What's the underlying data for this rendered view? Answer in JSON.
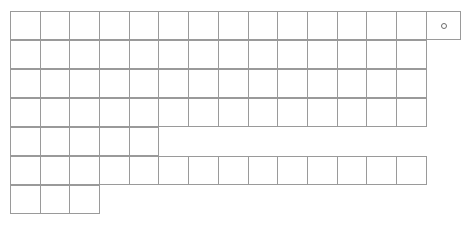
{
  "document": {
    "type": "blank-grid-worksheet",
    "background_color": "#ffffff",
    "line_color": "#9a9a9a",
    "mark_color": "#6d6d6d"
  },
  "grid": {
    "origin_x": 10,
    "origin_y": 11,
    "default_cell_width": 30.7,
    "default_cell_height": 29,
    "rows": [
      {
        "name": "row-1",
        "index": 1,
        "x": 10,
        "y": 11,
        "height": 29,
        "cells": [
          {
            "width": 30.7,
            "mark": ""
          },
          {
            "width": 30.7,
            "mark": ""
          },
          {
            "width": 30.7,
            "mark": ""
          },
          {
            "width": 30.7,
            "mark": ""
          },
          {
            "width": 30.7,
            "mark": ""
          },
          {
            "width": 30.7,
            "mark": ""
          },
          {
            "width": 30.7,
            "mark": ""
          },
          {
            "width": 30.7,
            "mark": ""
          },
          {
            "width": 30.7,
            "mark": ""
          },
          {
            "width": 30.7,
            "mark": ""
          },
          {
            "width": 30.7,
            "mark": ""
          },
          {
            "width": 30.7,
            "mark": ""
          },
          {
            "width": 30.7,
            "mark": ""
          },
          {
            "width": 30.7,
            "mark": ""
          },
          {
            "width": 35.8,
            "mark": "o"
          }
        ]
      },
      {
        "name": "row-2",
        "index": 2,
        "x": 10,
        "y": 40,
        "height": 29,
        "cells": [
          {
            "width": 30.7,
            "mark": ""
          },
          {
            "width": 30.7,
            "mark": ""
          },
          {
            "width": 30.7,
            "mark": ""
          },
          {
            "width": 30.7,
            "mark": ""
          },
          {
            "width": 30.7,
            "mark": ""
          },
          {
            "width": 30.7,
            "mark": ""
          },
          {
            "width": 30.7,
            "mark": ""
          },
          {
            "width": 30.7,
            "mark": ""
          },
          {
            "width": 30.7,
            "mark": ""
          },
          {
            "width": 30.7,
            "mark": ""
          },
          {
            "width": 30.7,
            "mark": ""
          },
          {
            "width": 30.7,
            "mark": ""
          },
          {
            "width": 30.7,
            "mark": ""
          },
          {
            "width": 30.7,
            "mark": ""
          }
        ]
      },
      {
        "name": "row-3",
        "index": 3,
        "x": 10,
        "y": 69,
        "height": 29,
        "cells": [
          {
            "width": 30.7,
            "mark": ""
          },
          {
            "width": 30.7,
            "mark": ""
          },
          {
            "width": 30.7,
            "mark": ""
          },
          {
            "width": 30.7,
            "mark": ""
          },
          {
            "width": 30.7,
            "mark": ""
          },
          {
            "width": 30.7,
            "mark": ""
          },
          {
            "width": 30.7,
            "mark": ""
          },
          {
            "width": 30.7,
            "mark": ""
          },
          {
            "width": 30.7,
            "mark": ""
          },
          {
            "width": 30.7,
            "mark": ""
          },
          {
            "width": 30.7,
            "mark": ""
          },
          {
            "width": 30.7,
            "mark": ""
          },
          {
            "width": 30.7,
            "mark": ""
          },
          {
            "width": 30.7,
            "mark": ""
          }
        ]
      },
      {
        "name": "row-4",
        "index": 4,
        "x": 10,
        "y": 98,
        "height": 29,
        "cells": [
          {
            "width": 30.7,
            "mark": ""
          },
          {
            "width": 30.7,
            "mark": ""
          },
          {
            "width": 30.7,
            "mark": ""
          },
          {
            "width": 30.7,
            "mark": ""
          },
          {
            "width": 30.7,
            "mark": ""
          },
          {
            "width": 30.7,
            "mark": ""
          },
          {
            "width": 30.7,
            "mark": ""
          },
          {
            "width": 30.7,
            "mark": ""
          },
          {
            "width": 30.7,
            "mark": ""
          },
          {
            "width": 30.7,
            "mark": ""
          },
          {
            "width": 30.7,
            "mark": ""
          },
          {
            "width": 30.7,
            "mark": ""
          },
          {
            "width": 30.7,
            "mark": ""
          },
          {
            "width": 30.7,
            "mark": ""
          }
        ]
      },
      {
        "name": "row-5",
        "index": 5,
        "x": 10,
        "y": 127,
        "height": 29,
        "cells": [
          {
            "width": 30.7,
            "mark": ""
          },
          {
            "width": 30.7,
            "mark": ""
          },
          {
            "width": 30.7,
            "mark": ""
          },
          {
            "width": 30.7,
            "mark": ""
          },
          {
            "width": 30.7,
            "mark": ""
          }
        ]
      },
      {
        "name": "row-6",
        "index": 6,
        "x": 10,
        "y": 156,
        "height": 29,
        "cells": [
          {
            "width": 30.7,
            "mark": ""
          },
          {
            "width": 30.7,
            "mark": ""
          },
          {
            "width": 30.7,
            "mark": ""
          },
          {
            "width": 30.7,
            "mark": ""
          },
          {
            "width": 30.7,
            "mark": ""
          },
          {
            "width": 30.7,
            "mark": ""
          },
          {
            "width": 30.7,
            "mark": ""
          },
          {
            "width": 30.7,
            "mark": ""
          },
          {
            "width": 30.7,
            "mark": ""
          },
          {
            "width": 30.7,
            "mark": ""
          },
          {
            "width": 30.7,
            "mark": ""
          },
          {
            "width": 30.7,
            "mark": ""
          },
          {
            "width": 30.7,
            "mark": ""
          },
          {
            "width": 30.7,
            "mark": ""
          }
        ]
      },
      {
        "name": "row-7",
        "index": 7,
        "x": 10,
        "y": 185,
        "height": 29,
        "cells": [
          {
            "width": 30.7,
            "mark": ""
          },
          {
            "width": 30.7,
            "mark": ""
          },
          {
            "width": 30.7,
            "mark": ""
          }
        ]
      }
    ]
  }
}
